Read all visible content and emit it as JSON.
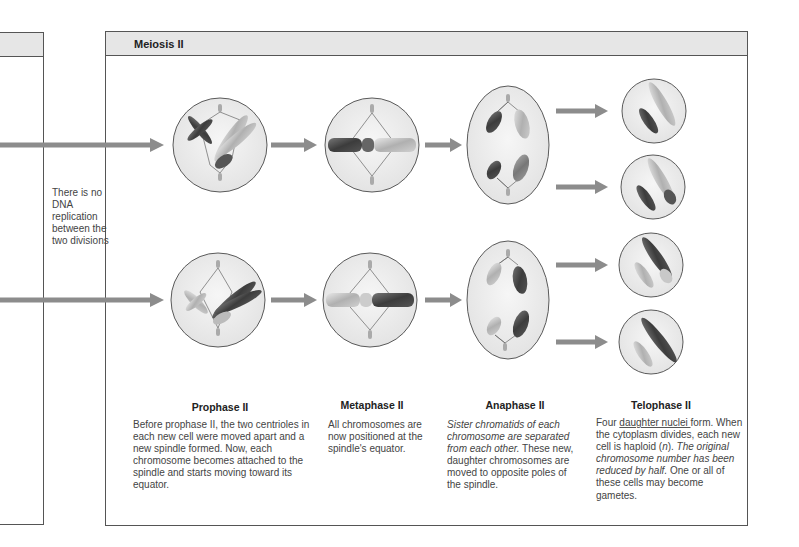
{
  "section": {
    "title": "Meiosis II"
  },
  "side_note": {
    "text": "There is no DNA replication between the two divisions"
  },
  "stages": [
    {
      "name": "Prophase II",
      "description": "Before prophase II, the two centrioles in each new cell were moved apart and a new spindle formed. Now, each chromosome becomes attached to the spindle and starts moving toward its equator."
    },
    {
      "name": "Metaphase II",
      "description": "All chromosomes are now positioned at the spindle's equator."
    },
    {
      "name": "Anaphase II",
      "description_italic": "Sister chromatids of each chromosome are separated from each other.",
      "description_rest": " These new, daughter chromosomes are moved to opposite poles of the spindle."
    },
    {
      "name": "Telophase II",
      "desc_part1": "Four ",
      "desc_underlined": "daughter nuclei ",
      "desc_part2": "form. When the cytoplasm divides, each new cell is haploid (",
      "desc_n": "n",
      "desc_part3": "). ",
      "desc_italic": "The original chromosome number has been reduced by half.",
      "desc_part4": " One or all of these cells may become gametes."
    }
  ],
  "colors": {
    "arrow": "#8c8c8c",
    "cell_fill": "#ececec",
    "cell_stroke": "#5a5a5a",
    "header_fill": "#e6e6e6",
    "chromosome_dark": "#4a4a4a",
    "chromosome_light": "#bcbcbc"
  }
}
